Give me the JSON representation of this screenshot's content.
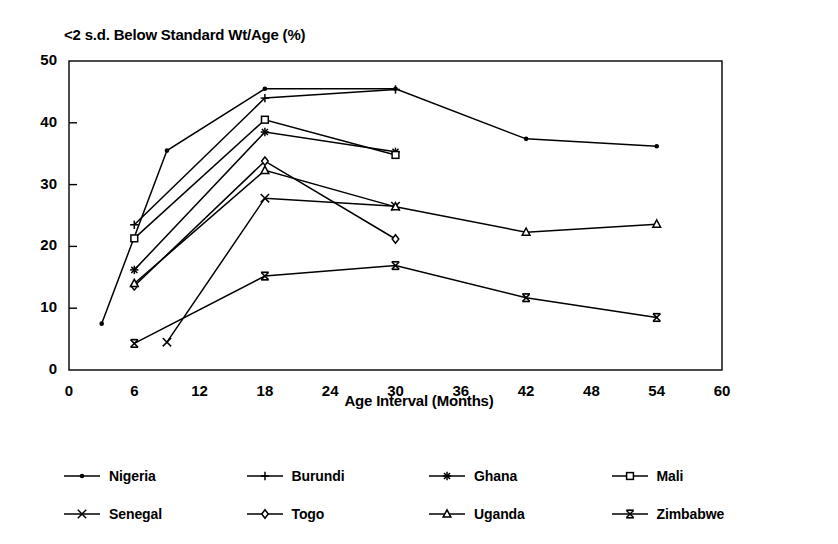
{
  "chart_data": {
    "type": "line",
    "title": "<2 s.d. Below Standard Wt/Age (%)",
    "xlabel": "Age Interval (Months)",
    "ylabel": "",
    "xlim": [
      0,
      60
    ],
    "ylim": [
      0,
      50
    ],
    "xticks": [
      0,
      6,
      12,
      18,
      24,
      30,
      36,
      42,
      48,
      54,
      60
    ],
    "xtick_labels": [
      "0",
      "6",
      "12",
      "18",
      "24",
      "30",
      "36",
      "42",
      "48",
      "54",
      "60"
    ],
    "yticks": [
      0,
      10,
      20,
      30,
      40,
      50
    ],
    "ytick_labels": [
      "0",
      "10",
      "20",
      "30",
      "40",
      "50"
    ],
    "grid": false,
    "legend_position": "bottom",
    "color": "#000000",
    "series": [
      {
        "name": "Nigeria",
        "marker": "dot",
        "x": [
          3,
          9,
          18,
          30,
          42,
          54
        ],
        "values": [
          7.5,
          35.5,
          45.5,
          45.5,
          37.4,
          36.2
        ]
      },
      {
        "name": "Burundi",
        "marker": "plus",
        "x": [
          6,
          18,
          30
        ],
        "values": [
          23.5,
          44.0,
          45.4
        ]
      },
      {
        "name": "Ghana",
        "marker": "asterisk",
        "x": [
          6,
          18,
          30
        ],
        "values": [
          16.2,
          38.5,
          35.3
        ]
      },
      {
        "name": "Mali",
        "marker": "square",
        "x": [
          6,
          18,
          30
        ],
        "values": [
          21.3,
          40.5,
          34.8
        ]
      },
      {
        "name": "Senegal",
        "marker": "cross",
        "x": [
          9,
          18,
          30
        ],
        "values": [
          4.5,
          27.8,
          26.5
        ]
      },
      {
        "name": "Togo",
        "marker": "diamond",
        "x": [
          6,
          18,
          30
        ],
        "values": [
          13.6,
          33.8,
          21.2
        ]
      },
      {
        "name": "Uganda",
        "marker": "triangle",
        "x": [
          6,
          18,
          30,
          42,
          54
        ],
        "values": [
          14.0,
          32.3,
          26.4,
          22.3,
          23.6
        ]
      },
      {
        "name": "Zimbabwe",
        "marker": "x-bar",
        "x": [
          6,
          18,
          30,
          42,
          54
        ],
        "values": [
          4.3,
          15.2,
          16.9,
          11.7,
          8.5
        ]
      }
    ]
  },
  "legend": {
    "entries": [
      {
        "label": "Nigeria",
        "marker": "dot"
      },
      {
        "label": "Burundi",
        "marker": "plus"
      },
      {
        "label": "Ghana",
        "marker": "asterisk"
      },
      {
        "label": "Mali",
        "marker": "square"
      },
      {
        "label": "Senegal",
        "marker": "cross"
      },
      {
        "label": "Togo",
        "marker": "diamond"
      },
      {
        "label": "Uganda",
        "marker": "triangle"
      },
      {
        "label": "Zimbabwe",
        "marker": "x-bar"
      }
    ]
  }
}
